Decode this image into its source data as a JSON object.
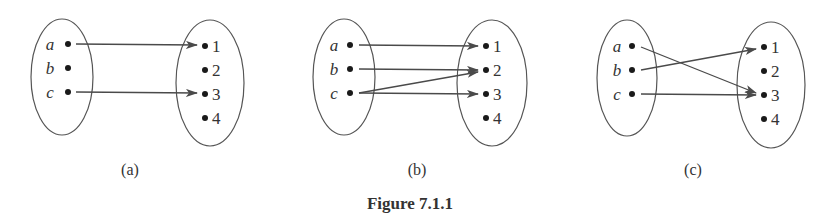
{
  "figure": {
    "caption": "Figure 7.1.1",
    "colors": {
      "stroke": "#555555",
      "dot": "#1a1a1a",
      "text": "#333333",
      "arrow": "#4a4a4a"
    },
    "panels": [
      {
        "id": "a",
        "label": "(a)",
        "domain": [
          "a",
          "b",
          "c"
        ],
        "codomain": [
          "1",
          "2",
          "3",
          "4"
        ],
        "mappings": [
          {
            "from": "a",
            "to": "1"
          },
          {
            "from": "c",
            "to": "3"
          }
        ]
      },
      {
        "id": "b",
        "label": "(b)",
        "domain": [
          "a",
          "b",
          "c"
        ],
        "codomain": [
          "1",
          "2",
          "3",
          "4"
        ],
        "mappings": [
          {
            "from": "a",
            "to": "1"
          },
          {
            "from": "b",
            "to": "2"
          },
          {
            "from": "c",
            "to": "2"
          },
          {
            "from": "c",
            "to": "3"
          }
        ]
      },
      {
        "id": "c",
        "label": "(c)",
        "domain": [
          "a",
          "b",
          "c"
        ],
        "codomain": [
          "1",
          "2",
          "3",
          "4"
        ],
        "mappings": [
          {
            "from": "a",
            "to": "3"
          },
          {
            "from": "b",
            "to": "1"
          },
          {
            "from": "c",
            "to": "3"
          }
        ]
      }
    ]
  }
}
